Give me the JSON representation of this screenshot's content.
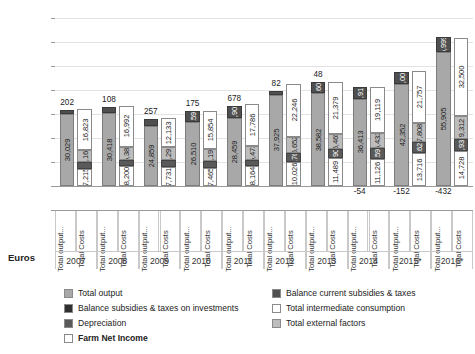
{
  "chart_data": {
    "type": "bar",
    "subtype": "stacked-bar-pairs",
    "title": "",
    "xlabel": "",
    "ylabel": "Euros",
    "ylim": [
      -10000,
      70000
    ],
    "ytick_labels": [
      "70000",
      "60000",
      "50000",
      "40000",
      "30000",
      "20000",
      "10000",
      "0",
      "-10000"
    ],
    "ytick_values": [
      70000,
      60000,
      50000,
      40000,
      30000,
      20000,
      10000,
      0,
      -10000
    ],
    "grid": true,
    "legend_position": "bottom",
    "categories": [
      "2007",
      "2008",
      "2009",
      "2010",
      "2011",
      "2012",
      "2013",
      "2014",
      "2015*",
      "2016*"
    ],
    "subcategories": [
      "Total output...",
      "Total Costs"
    ],
    "series": [
      {
        "name": "Total output",
        "key": "total_output",
        "color": "#a8a8a8",
        "values": [
          30029,
          30418,
          24859,
          26510,
          28459,
          37925,
          38582,
          36413,
          42352,
          55905
        ]
      },
      {
        "name": "Balance current subsidies & taxes",
        "key": "balance_current",
        "color": "#4f4f4f",
        "values": [
          1683,
          2585,
          3132,
          4594,
          4902,
          1679,
          4607,
          4917,
          5004,
          5999
        ]
      },
      {
        "name": "Balance subsidies & taxes on investments",
        "key": "balance_investments",
        "color": "#2f2f2f",
        "values": [
          202,
          108,
          257,
          175,
          678,
          82,
          48,
          -54,
          -152,
          -432
        ]
      },
      {
        "name": "Total intermediate consumption",
        "key": "intermediate",
        "color": "#ffffff",
        "values": [
          16823,
          16992,
          12133,
          15854,
          17786,
          22246,
          21379,
          19119,
          21757,
          32500
        ]
      },
      {
        "name": "Depreciation",
        "key": "depreciation",
        "color": "#5a5a5a",
        "values": [
          2680,
          2839,
          3072,
          2787,
          2876,
          3762,
          3903,
          4598,
          4620,
          4932
        ]
      },
      {
        "name": "Total external factors",
        "key": "external_factors",
        "color": "#bdbdbd",
        "values": [
          5166,
          5385,
          5291,
          5193,
          5473,
          6652,
          6465,
          6433,
          7808,
          9312
        ]
      },
      {
        "name": "Farm Net Income",
        "key": "farm_net_income",
        "color": "#ffffff",
        "values": [
          7215,
          8200,
          7731,
          7465,
          8164,
          10026,
          11489,
          11126,
          13716,
          14728
        ]
      }
    ],
    "annotations": {
      "investment_balance_labels": [
        "202",
        "108",
        "257",
        "175",
        "678",
        "82",
        "48",
        "-54",
        "-152",
        "-432"
      ]
    }
  },
  "axis": {
    "y_title": "Euros"
  },
  "legend": {
    "items": [
      {
        "label": "Total output",
        "color": "#a8a8a8",
        "bold": false
      },
      {
        "label": "Balance current subsidies & taxes",
        "color": "#4f4f4f",
        "bold": false
      },
      {
        "label": "Balance subsidies & taxes on investments",
        "color": "#2f2f2f",
        "bold": false
      },
      {
        "label": "Total intermediate consumption",
        "color": "#ffffff",
        "bold": false
      },
      {
        "label": "Depreciation",
        "color": "#5a5a5a",
        "bold": false
      },
      {
        "label": "Total external factors",
        "color": "#bdbdbd",
        "bold": false
      },
      {
        "label": "Farm Net Income",
        "color": "#ffffff",
        "bold": true
      }
    ]
  },
  "bars": {
    "output_label": "Total output...",
    "costs_label": "Total Costs"
  }
}
